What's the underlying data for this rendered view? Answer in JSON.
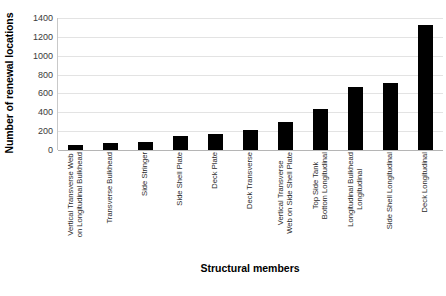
{
  "chart_data": {
    "type": "bar",
    "title": "",
    "xlabel": "Structural members",
    "ylabel": "Number of renewal locations",
    "ylim": [
      0,
      1400
    ],
    "ytick_step": 200,
    "yticks": [
      0,
      200,
      400,
      600,
      800,
      1000,
      1200,
      1400
    ],
    "ytick_labels": [
      "0",
      "200",
      "400",
      "600",
      "800",
      "1000",
      "1200",
      "1400"
    ],
    "grid": true,
    "legend": false,
    "bar_color": "#000000",
    "categories": [
      "Vertical Transverse Web on Longitudinal Bulkhead",
      "Transverse Bulkhead",
      "Side Stringer",
      "Side Shell Plate",
      "Deck Plate",
      "Deck Transverse",
      "Vertical Transverse Web on Side Shell Plate",
      "Top Side Tank Bottom Longitudinal",
      "Longitudinal Bulkhead Longitudinal",
      "Side Shell Longitudinal",
      "Deck Longitudinal"
    ],
    "category_lines": [
      [
        "Vertical Transverse Web",
        "on Longitudinal Bulkhead"
      ],
      [
        "Transverse Bulkhead",
        ""
      ],
      [
        "Side Stringer",
        ""
      ],
      [
        "Side Shell Plate",
        ""
      ],
      [
        "Deck Plate",
        ""
      ],
      [
        "Deck Transverse",
        ""
      ],
      [
        "Vertical Transverse",
        "Web on Side Shell Plate"
      ],
      [
        "Top Side Tank",
        "Bottom Longitudinal"
      ],
      [
        "Longitudinal Bulkhead",
        "Longitudinal"
      ],
      [
        "Side Shell Longitudinal",
        ""
      ],
      [
        "Deck Longitudinal",
        ""
      ]
    ],
    "values": [
      55,
      70,
      85,
      150,
      175,
      215,
      295,
      440,
      665,
      715,
      1325
    ]
  }
}
